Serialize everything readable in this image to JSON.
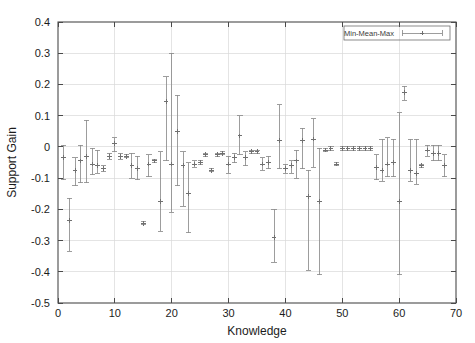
{
  "chart": {
    "type": "errorbar-scatter",
    "background_color": "#ffffff",
    "axis_color": "#4a4a4a",
    "grid_color": "#d9d9d9",
    "series_color": "#8c8c8c",
    "legend": {
      "label": "Min-Mean-Max",
      "position": "top-right",
      "border": true
    }
  },
  "chart_data": {
    "type": "scatter",
    "title": "",
    "subtitle": "",
    "xlabel": "Knowledge",
    "ylabel": "Support Gain",
    "xlim": [
      0,
      70
    ],
    "ylim": [
      -0.5,
      0.4
    ],
    "xticks": [
      0,
      10,
      20,
      30,
      40,
      50,
      60,
      70
    ],
    "xticklabels": [
      "0",
      "10",
      "20",
      "30",
      "40",
      "50",
      "60",
      "70"
    ],
    "yticks": [
      0.4,
      0.3,
      0.2,
      0.1,
      0,
      -0.1,
      -0.2,
      -0.3,
      -0.4,
      -0.5
    ],
    "yticklabels": [
      "0.4",
      "0.3",
      "0.2",
      "0.1",
      "0",
      "-0.1",
      "-0.2",
      "-0.3",
      "-0.4",
      "-0.5"
    ],
    "grid": true,
    "legend": [
      "Min-Mean-Max"
    ],
    "legend_position": "top right",
    "series": [
      {
        "name": "Min-Mean-Max",
        "marker": "plus-with-errorbars",
        "color": "#8c8c8c",
        "points": [
          {
            "x": 1,
            "mean": -0.035,
            "min": -0.105,
            "max": 0.005
          },
          {
            "x": 2,
            "mean": -0.235,
            "min": -0.335,
            "max": -0.165
          },
          {
            "x": 3,
            "mean": -0.075,
            "min": -0.125,
            "max": -0.035
          },
          {
            "x": 4,
            "mean": -0.045,
            "min": -0.115,
            "max": 0.005
          },
          {
            "x": 5,
            "mean": -0.03,
            "min": -0.115,
            "max": 0.085
          },
          {
            "x": 6,
            "mean": -0.055,
            "min": -0.09,
            "max": -0.005
          },
          {
            "x": 7,
            "mean": -0.06,
            "min": -0.085,
            "max": -0.01
          },
          {
            "x": 8,
            "mean": -0.07,
            "min": -0.08,
            "max": -0.06
          },
          {
            "x": 9,
            "mean": -0.03,
            "min": -0.04,
            "max": -0.02
          },
          {
            "x": 10,
            "mean": 0.01,
            "min": -0.015,
            "max": 0.03
          },
          {
            "x": 11,
            "mean": -0.03,
            "min": -0.04,
            "max": -0.02
          },
          {
            "x": 12,
            "mean": -0.03,
            "min": -0.035,
            "max": -0.025
          },
          {
            "x": 13,
            "mean": -0.06,
            "min": -0.1,
            "max": -0.02
          },
          {
            "x": 14,
            "mean": -0.07,
            "min": -0.105,
            "max": -0.03
          },
          {
            "x": 15,
            "mean": -0.245,
            "min": -0.25,
            "max": -0.24
          },
          {
            "x": 16,
            "mean": -0.055,
            "min": -0.095,
            "max": -0.025
          },
          {
            "x": 17,
            "mean": -0.045,
            "min": -0.05,
            "max": -0.04
          },
          {
            "x": 18,
            "mean": -0.175,
            "min": -0.27,
            "max": -0.015
          },
          {
            "x": 19,
            "mean": 0.145,
            "min": -0.045,
            "max": 0.225
          },
          {
            "x": 20,
            "mean": -0.055,
            "min": -0.21,
            "max": 0.3
          },
          {
            "x": 21,
            "mean": 0.05,
            "min": -0.125,
            "max": 0.165
          },
          {
            "x": 22,
            "mean": -0.06,
            "min": -0.19,
            "max": -0.015
          },
          {
            "x": 23,
            "mean": -0.15,
            "min": -0.275,
            "max": -0.05
          },
          {
            "x": 24,
            "mean": -0.055,
            "min": -0.065,
            "max": -0.045
          },
          {
            "x": 25,
            "mean": -0.05,
            "min": -0.055,
            "max": -0.045
          },
          {
            "x": 26,
            "mean": -0.025,
            "min": -0.03,
            "max": -0.02
          },
          {
            "x": 27,
            "mean": -0.075,
            "min": -0.08,
            "max": -0.07
          },
          {
            "x": 28,
            "mean": -0.025,
            "min": -0.03,
            "max": -0.02
          },
          {
            "x": 29,
            "mean": -0.02,
            "min": -0.025,
            "max": -0.015
          },
          {
            "x": 30,
            "mean": -0.055,
            "min": -0.085,
            "max": -0.03
          },
          {
            "x": 31,
            "mean": -0.035,
            "min": -0.05,
            "max": -0.02
          },
          {
            "x": 32,
            "mean": 0.035,
            "min": -0.025,
            "max": 0.1
          },
          {
            "x": 33,
            "mean": -0.035,
            "min": -0.06,
            "max": -0.015
          },
          {
            "x": 34,
            "mean": -0.015,
            "min": -0.02,
            "max": -0.01
          },
          {
            "x": 35,
            "mean": -0.015,
            "min": -0.02,
            "max": -0.01
          },
          {
            "x": 36,
            "mean": -0.055,
            "min": -0.075,
            "max": -0.035
          },
          {
            "x": 37,
            "mean": -0.05,
            "min": -0.07,
            "max": -0.03
          },
          {
            "x": 38,
            "mean": -0.29,
            "min": -0.37,
            "max": -0.2
          },
          {
            "x": 39,
            "mean": 0.02,
            "min": -0.07,
            "max": 0.135
          },
          {
            "x": 40,
            "mean": -0.07,
            "min": -0.085,
            "max": -0.055
          },
          {
            "x": 41,
            "mean": -0.06,
            "min": -0.085,
            "max": -0.045
          },
          {
            "x": 42,
            "mean": -0.045,
            "min": -0.1,
            "max": -0.01
          },
          {
            "x": 43,
            "mean": 0.02,
            "min": -0.07,
            "max": 0.06
          },
          {
            "x": 44,
            "mean": -0.16,
            "min": -0.395,
            "max": -0.075
          },
          {
            "x": 45,
            "mean": 0.025,
            "min": -0.065,
            "max": 0.09
          },
          {
            "x": 46,
            "mean": -0.175,
            "min": -0.41,
            "max": -0.005
          },
          {
            "x": 47,
            "mean": -0.01,
            "min": -0.015,
            "max": -0.005
          },
          {
            "x": 48,
            "mean": -0.005,
            "min": -0.01,
            "max": 0.0
          },
          {
            "x": 49,
            "mean": -0.055,
            "min": -0.06,
            "max": -0.05
          },
          {
            "x": 50,
            "mean": -0.005,
            "min": -0.01,
            "max": 0.0
          },
          {
            "x": 51,
            "mean": -0.005,
            "min": -0.01,
            "max": 0.0
          },
          {
            "x": 52,
            "mean": -0.005,
            "min": -0.01,
            "max": 0.0
          },
          {
            "x": 53,
            "mean": -0.005,
            "min": -0.01,
            "max": 0.0
          },
          {
            "x": 54,
            "mean": -0.005,
            "min": -0.01,
            "max": 0.0
          },
          {
            "x": 55,
            "mean": -0.005,
            "min": -0.01,
            "max": 0.0
          },
          {
            "x": 56,
            "mean": -0.065,
            "min": -0.105,
            "max": -0.025
          },
          {
            "x": 57,
            "mean": -0.075,
            "min": -0.11,
            "max": 0.025
          },
          {
            "x": 58,
            "mean": -0.055,
            "min": -0.095,
            "max": 0.03
          },
          {
            "x": 59,
            "mean": -0.05,
            "min": -0.095,
            "max": 0.025
          },
          {
            "x": 60,
            "mean": -0.175,
            "min": -0.41,
            "max": 0.11
          },
          {
            "x": 61,
            "mean": 0.175,
            "min": 0.15,
            "max": 0.195
          },
          {
            "x": 62,
            "mean": -0.075,
            "min": -0.11,
            "max": 0.025
          },
          {
            "x": 63,
            "mean": -0.085,
            "min": -0.12,
            "max": 0.025
          },
          {
            "x": 64,
            "mean": -0.06,
            "min": -0.065,
            "max": -0.055
          },
          {
            "x": 65,
            "mean": -0.01,
            "min": -0.03,
            "max": 0.005
          },
          {
            "x": 66,
            "mean": -0.02,
            "min": -0.045,
            "max": 0.005
          },
          {
            "x": 67,
            "mean": -0.02,
            "min": -0.045,
            "max": 0.005
          },
          {
            "x": 68,
            "mean": -0.06,
            "min": -0.095,
            "max": -0.025
          }
        ]
      }
    ]
  },
  "plot_geometry": {
    "left": 58,
    "right": 456,
    "top": 22,
    "bottom": 303
  }
}
